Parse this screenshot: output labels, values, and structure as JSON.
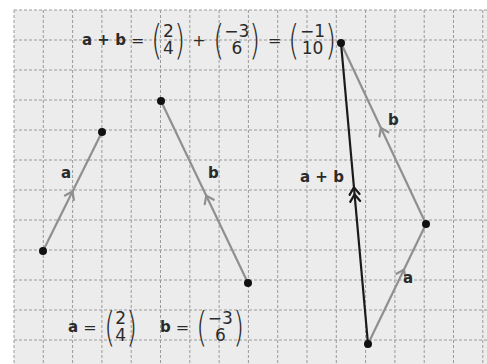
{
  "grid": {
    "origin_x": 14,
    "origin_y": 10,
    "cell_w": 29.3,
    "cell_h": 30,
    "background": "#ececec",
    "line_color": "#9a9a9a"
  },
  "colors": {
    "vector_light": "#8f8f8f",
    "vector_dark": "#1a1a1a",
    "point": "#111111",
    "text": "#2a2a2a"
  },
  "header_equation": {
    "lhs": "a + b",
    "equals": "=",
    "plus": "+",
    "a_vec": {
      "top": "2",
      "bottom": "4"
    },
    "b_vec": {
      "top": "−3",
      "bottom": "6"
    },
    "sum_vec": {
      "top": "−1",
      "bottom": "10"
    }
  },
  "definitions": {
    "a": {
      "name": "a",
      "equals": "=",
      "top": "2",
      "bottom": "4"
    },
    "b": {
      "name": "b",
      "equals": "=",
      "top": "−3",
      "bottom": "6"
    }
  },
  "vectors": [
    {
      "id": "a-left",
      "label": "a",
      "from": [
        43,
        251
      ],
      "to": [
        102,
        132
      ],
      "color": "light",
      "arrow": "single",
      "arrow_at": 0.5
    },
    {
      "id": "b-middle",
      "label": "b",
      "from": [
        248,
        283
      ],
      "to": [
        161,
        101
      ],
      "color": "light",
      "arrow": "single",
      "arrow_at": 0.48
    },
    {
      "id": "a-right",
      "label": "a",
      "from": [
        368,
        344
      ],
      "to": [
        426,
        224
      ],
      "color": "light",
      "arrow": "single",
      "arrow_at": 0.62
    },
    {
      "id": "b-right",
      "label": "b",
      "from": [
        426,
        224
      ],
      "to": [
        341,
        43
      ],
      "color": "light",
      "arrow": "single",
      "arrow_at": 0.53
    },
    {
      "id": "a-plus-b",
      "label": "a + b",
      "from": [
        368,
        344
      ],
      "to": [
        341,
        43
      ],
      "color": "dark",
      "arrow": "double",
      "arrow_at": 0.52
    }
  ],
  "labels": {
    "a_left": "a",
    "b_middle": "b",
    "a_right": "a",
    "b_right": "b",
    "a_plus_b": "a + b"
  }
}
